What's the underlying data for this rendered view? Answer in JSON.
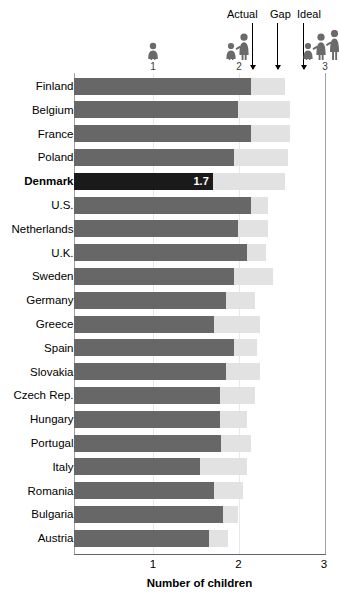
{
  "legend": {
    "actual_label": "Actual",
    "gap_label": "Gap",
    "ideal_label": "Ideal"
  },
  "pictograms": [
    {
      "name": "one-child-icon",
      "number": "1",
      "children": 1
    },
    {
      "name": "two-children-icon",
      "number": "2",
      "children": 2
    },
    {
      "name": "three-children-icon",
      "number": "3",
      "children": 3
    }
  ],
  "axis": {
    "title": "Number of children",
    "ticks": [
      "1",
      "2",
      "3"
    ],
    "tick_values": [
      1,
      2,
      3
    ],
    "min": 0,
    "max": 3
  },
  "colors": {
    "actual_bar": "#676767",
    "highlight_bar": "#1a1a1a",
    "ideal_bar": "#e2e2e2",
    "axis": "#5a6472",
    "gridline": "#e8e8e8"
  },
  "highlight": {
    "country": "Denmark",
    "value_label": "1.7"
  },
  "chart_data": {
    "type": "bar",
    "title": "",
    "subtitle": "",
    "xlabel": "Number of children",
    "ylabel": "",
    "xlim": [
      0,
      3
    ],
    "grid": true,
    "legend_position": "top",
    "orientation": "horizontal",
    "stacked": true,
    "categories": [
      "Finland",
      "Belgium",
      "France",
      "Poland",
      "Denmark",
      "U.S.",
      "Netherlands",
      "U.K.",
      "Sweden",
      "Germany",
      "Greece",
      "Spain",
      "Slovakia",
      "Czech Rep.",
      "Hungary",
      "Portugal",
      "Italy",
      "Romania",
      "Bulgaria",
      "Austria"
    ],
    "series": [
      {
        "name": "Actual",
        "values": [
          2.15,
          2.0,
          2.15,
          1.95,
          1.7,
          2.15,
          2.0,
          2.1,
          1.95,
          1.85,
          1.72,
          1.95,
          1.85,
          1.78,
          1.78,
          1.8,
          1.55,
          1.72,
          1.82,
          1.65
        ]
      },
      {
        "name": "Ideal",
        "values": [
          2.55,
          2.6,
          2.6,
          2.58,
          2.55,
          2.35,
          2.35,
          2.32,
          2.4,
          2.2,
          2.25,
          2.22,
          2.25,
          2.2,
          2.1,
          2.15,
          2.1,
          2.05,
          2.0,
          1.88
        ]
      }
    ],
    "annotations": [
      {
        "country": "Denmark",
        "label": "1.7",
        "note": "highlighted row"
      }
    ]
  },
  "rows": [
    {
      "country": "Finland",
      "actual": 2.15,
      "ideal": 2.55,
      "highlight": false,
      "value_label": ""
    },
    {
      "country": "Belgium",
      "actual": 2.0,
      "ideal": 2.6,
      "highlight": false,
      "value_label": ""
    },
    {
      "country": "France",
      "actual": 2.15,
      "ideal": 2.6,
      "highlight": false,
      "value_label": ""
    },
    {
      "country": "Poland",
      "actual": 1.95,
      "ideal": 2.58,
      "highlight": false,
      "value_label": ""
    },
    {
      "country": "Denmark",
      "actual": 1.7,
      "ideal": 2.55,
      "highlight": true,
      "value_label": "1.7"
    },
    {
      "country": "U.S.",
      "actual": 2.15,
      "ideal": 2.35,
      "highlight": false,
      "value_label": ""
    },
    {
      "country": "Netherlands",
      "actual": 2.0,
      "ideal": 2.35,
      "highlight": false,
      "value_label": ""
    },
    {
      "country": "U.K.",
      "actual": 2.1,
      "ideal": 2.32,
      "highlight": false,
      "value_label": ""
    },
    {
      "country": "Sweden",
      "actual": 1.95,
      "ideal": 2.4,
      "highlight": false,
      "value_label": ""
    },
    {
      "country": "Germany",
      "actual": 1.85,
      "ideal": 2.2,
      "highlight": false,
      "value_label": ""
    },
    {
      "country": "Greece",
      "actual": 1.72,
      "ideal": 2.25,
      "highlight": false,
      "value_label": ""
    },
    {
      "country": "Spain",
      "actual": 1.95,
      "ideal": 2.22,
      "highlight": false,
      "value_label": ""
    },
    {
      "country": "Slovakia",
      "actual": 1.85,
      "ideal": 2.25,
      "highlight": false,
      "value_label": ""
    },
    {
      "country": "Czech Rep.",
      "actual": 1.78,
      "ideal": 2.2,
      "highlight": false,
      "value_label": ""
    },
    {
      "country": "Hungary",
      "actual": 1.78,
      "ideal": 2.1,
      "highlight": false,
      "value_label": ""
    },
    {
      "country": "Portugal",
      "actual": 1.8,
      "ideal": 2.15,
      "highlight": false,
      "value_label": ""
    },
    {
      "country": "Italy",
      "actual": 1.55,
      "ideal": 2.1,
      "highlight": false,
      "value_label": ""
    },
    {
      "country": "Romania",
      "actual": 1.72,
      "ideal": 2.05,
      "highlight": false,
      "value_label": ""
    },
    {
      "country": "Bulgaria",
      "actual": 1.82,
      "ideal": 2.0,
      "highlight": false,
      "value_label": ""
    },
    {
      "country": "Austria",
      "actual": 1.65,
      "ideal": 1.88,
      "highlight": false,
      "value_label": ""
    }
  ]
}
